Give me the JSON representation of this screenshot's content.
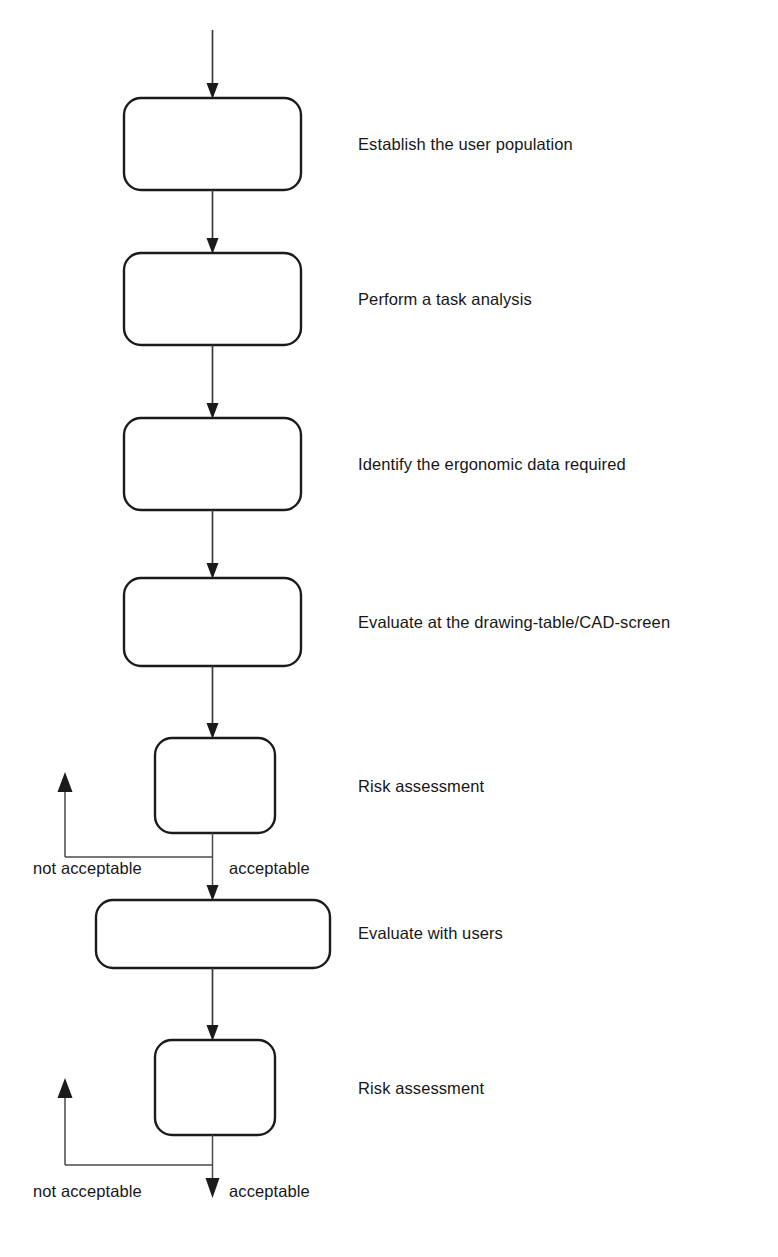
{
  "diagram": {
    "background_color": "#ffffff",
    "box_stroke_color": "#1b1b1b",
    "line_color": "#3a3a3a",
    "text_color": "#171717",
    "entry_arrow": {
      "name": "entry-arrow",
      "direction": "down"
    },
    "steps": [
      {
        "id": "establish-user-population",
        "label": "Establish the user population",
        "box": {
          "x": 124,
          "y": 98,
          "w": 177,
          "h": 92,
          "r": 17
        },
        "label_pos": {
          "x": 358,
          "y": 136
        }
      },
      {
        "id": "perform-task-analysis",
        "label": "Perform a task analysis",
        "box": {
          "x": 124,
          "y": 253,
          "w": 177,
          "h": 92,
          "r": 17
        },
        "label_pos": {
          "x": 358,
          "y": 291
        }
      },
      {
        "id": "identify-ergonomic-data",
        "label": "Identify the ergonomic data required",
        "box": {
          "x": 124,
          "y": 418,
          "w": 177,
          "h": 92,
          "r": 17
        },
        "label_pos": {
          "x": 358,
          "y": 456
        }
      },
      {
        "id": "evaluate-drawing-table-cad-screen",
        "label": "Evaluate at the drawing-table/CAD-screen",
        "box": {
          "x": 124,
          "y": 578,
          "w": 177,
          "h": 88,
          "r": 17
        },
        "label_pos": {
          "x": 358,
          "y": 614
        }
      },
      {
        "id": "risk-assessment-1",
        "label": "Risk assessment",
        "box": {
          "x": 155,
          "y": 738,
          "w": 120,
          "h": 95,
          "r": 17
        },
        "label_pos": {
          "x": 358,
          "y": 778
        }
      },
      {
        "id": "evaluate-with-users",
        "label": "Evaluate with users",
        "box": {
          "x": 96,
          "y": 900,
          "w": 234,
          "h": 68,
          "r": 17
        },
        "label_pos": {
          "x": 358,
          "y": 925
        }
      },
      {
        "id": "risk-assessment-2",
        "label": "Risk assessment",
        "box": {
          "x": 155,
          "y": 1040,
          "w": 120,
          "h": 95,
          "r": 17
        },
        "label_pos": {
          "x": 358,
          "y": 1080
        }
      }
    ],
    "branches": [
      {
        "id": "branch-risk-assessment-1",
        "not_acceptable_label": "not acceptable",
        "acceptable_label": "acceptable",
        "not_acceptable_pos": {
          "x": 33,
          "y": 860
        },
        "acceptable_pos": {
          "x": 229,
          "y": 860
        },
        "junction_y": 857,
        "feedback_x": 65,
        "feedback_top_y": 776,
        "exit_arrow_y": 900
      },
      {
        "id": "branch-risk-assessment-2",
        "not_acceptable_label": "not acceptable",
        "acceptable_label": "acceptable",
        "not_acceptable_pos": {
          "x": 33,
          "y": 1183
        },
        "acceptable_pos": {
          "x": 229,
          "y": 1183
        },
        "junction_y": 1165,
        "feedback_x": 65,
        "feedback_top_y": 1078,
        "exit_arrow_y": 1196
      }
    ]
  }
}
